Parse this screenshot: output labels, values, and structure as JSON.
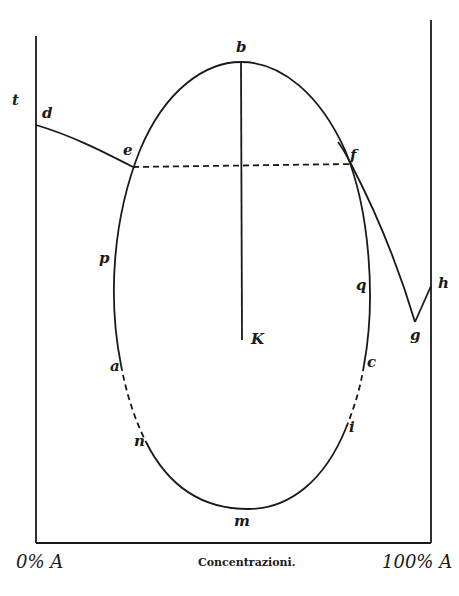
{
  "figure": {
    "axis_labels": {
      "y": "t",
      "x_left": "0% A",
      "x_center": "Concentrazioni.",
      "x_right": "100% A"
    },
    "point_labels": {
      "b": "b",
      "d": "d",
      "e": "e",
      "f": "f",
      "g": "g",
      "h": "h",
      "p": "p",
      "q": "q",
      "K": "K",
      "a": "a",
      "c": "c",
      "n": "n",
      "i": "i",
      "m": "m"
    }
  },
  "colors": {
    "ink": "#1a1a1a",
    "paper": "#ffffff"
  }
}
